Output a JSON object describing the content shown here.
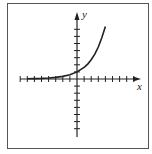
{
  "chart_data": {
    "type": "line",
    "title": "",
    "xlabel": "x",
    "ylabel": "y",
    "xlim": [
      -8,
      8
    ],
    "ylim": [
      -8,
      9
    ],
    "grid": false,
    "legend": null,
    "axis_ticks": {
      "x_ticks_each_side": 8,
      "y_ticks_above": 7,
      "y_ticks_below": 7,
      "tick_labels": []
    },
    "series": [
      {
        "name": "exponential curve",
        "function_shape": "exponential growth",
        "x": [
          -7,
          -6,
          -5,
          -4,
          -3,
          -2,
          -1,
          0,
          1,
          1.5,
          2,
          2.5,
          3,
          3.5,
          4
        ],
        "values": [
          0.03,
          0.05,
          0.08,
          0.14,
          0.22,
          0.37,
          0.61,
          1.0,
          1.65,
          2.1,
          2.7,
          3.5,
          4.5,
          5.8,
          7.4
        ]
      }
    ]
  },
  "labels": {
    "x_axis": "x",
    "y_axis": "y"
  },
  "colors": {
    "axis": "#222222",
    "curve": "#222222",
    "frame": "#555555",
    "background": "#ffffff"
  }
}
